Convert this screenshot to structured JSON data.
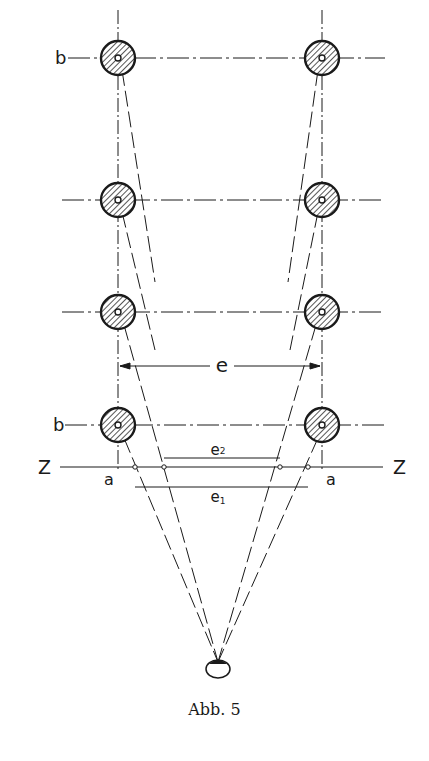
{
  "figure": {
    "caption": "Abb. 5",
    "labels": {
      "b_top": "b",
      "b_bottom": "b",
      "e": "e",
      "e1": "e",
      "e1_sub": "1",
      "e2": "e",
      "e2_sub": "2",
      "z_left": "Z",
      "z_right": "Z",
      "a_left": "a",
      "a_right": "a"
    },
    "elements": {
      "columns": "two rows of four hatched circular posts (left column x≈118, right column x≈322)",
      "rows_y": [
        58,
        200,
        312,
        425
      ],
      "picture_plane": "horizontal line Z–Z at y≈467",
      "eye": "small oval eye at bottom centre (x≈218, y≈665)",
      "dimension_e": "horizontal arrow between the post axes at y≈366",
      "dimension_e1": "line below Z at y≈487",
      "dimension_e2": "line above Z at y≈458"
    },
    "colors": {
      "ink": "#1a1a1a",
      "hatch_fill": "#6a6a6a",
      "paper": "#ffffff"
    }
  }
}
